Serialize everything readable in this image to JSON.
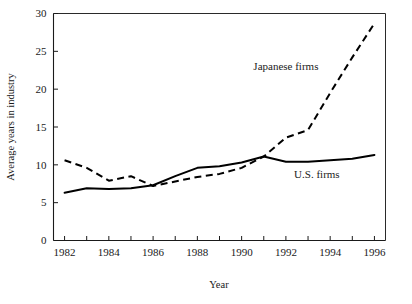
{
  "chart_data": {
    "type": "line",
    "title": "",
    "xlabel": "Year",
    "ylabel": "Average years in industry",
    "x": [
      1982,
      1983,
      1984,
      1985,
      1986,
      1987,
      1988,
      1989,
      1990,
      1991,
      1992,
      1993,
      1994,
      1995,
      1996
    ],
    "xlim": [
      1981.5,
      1996.5
    ],
    "ylim": [
      0,
      30
    ],
    "yticks": [
      0,
      5,
      10,
      15,
      20,
      25,
      30
    ],
    "ytick_labels": [
      "0",
      "5",
      "10",
      "15",
      "20",
      "25",
      "30"
    ],
    "xticks": [
      1982,
      1983,
      1984,
      1985,
      1986,
      1987,
      1988,
      1989,
      1990,
      1991,
      1992,
      1993,
      1994,
      1995,
      1996
    ],
    "xtick_labels_shown": [
      "1982",
      "1984",
      "1986",
      "1988",
      "1990",
      "1992",
      "1994",
      "1996"
    ],
    "xtick_label_values": [
      1982,
      1984,
      1986,
      1988,
      1990,
      1992,
      1994,
      1996
    ],
    "grid": false,
    "legend": "inline-annotations",
    "series": [
      {
        "name": "Japanese firms",
        "style": "dashed",
        "color": "#000000",
        "values": [
          10.6,
          9.6,
          7.9,
          8.5,
          7.2,
          7.8,
          8.4,
          8.8,
          9.6,
          11.1,
          13.6,
          14.6,
          19.5,
          24.2,
          28.7
        ],
        "annotation_at": {
          "x": 1992.0,
          "y": 22.5
        }
      },
      {
        "name": "U.S. firms",
        "style": "solid",
        "color": "#000000",
        "values": [
          6.3,
          6.9,
          6.8,
          6.9,
          7.3,
          8.5,
          9.6,
          9.8,
          10.3,
          11.1,
          10.4,
          10.4,
          10.6,
          10.8,
          11.3
        ],
        "annotation_at": {
          "x": 1993.4,
          "y": 8.2
        }
      }
    ]
  },
  "axis": {
    "y_title": "Average years in industry",
    "x_title": "Year"
  },
  "annotations": {
    "japanese_label": "Japanese firms",
    "us_label": "U.S. firms"
  },
  "colors": {
    "ink": "#000000",
    "axis": "#1a1a1a",
    "background": "#ffffff"
  }
}
